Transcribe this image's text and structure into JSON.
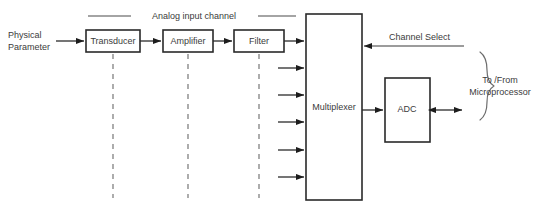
{
  "diagram": {
    "title_label": "Analog input channel",
    "source_label_line1": "Physical",
    "source_label_line2": "Parameter",
    "blocks": [
      {
        "id": "transducer",
        "label": "Transducer"
      },
      {
        "id": "amplifier",
        "label": "Amplifier"
      },
      {
        "id": "filter",
        "label": "Filter"
      },
      {
        "id": "multiplexer",
        "label": "Multiplexer"
      },
      {
        "id": "adc",
        "label": "ADC"
      }
    ],
    "signals": [
      {
        "id": "channel-select",
        "label": "Channel Select"
      }
    ],
    "annotations": [
      {
        "id": "microprocessor-bus",
        "line1": "To /From",
        "line2": "Microprocessor"
      }
    ],
    "multiplexer_input_count": "6",
    "colors": {
      "background": "#ffffff",
      "block_stroke": "#2a2a2a",
      "text": "#3b3b3b",
      "connector": "#2b2b2b",
      "dashed_guide": "#8a8a8a",
      "brace": "#6d6d6d"
    }
  }
}
